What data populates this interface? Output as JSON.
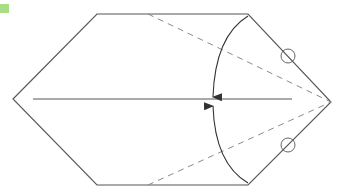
{
  "diagram": {
    "type": "origami-fold-step",
    "colors": {
      "badge": "#a9df84",
      "edge": "#555555",
      "valley_fold": "#8a8a8a",
      "arrow": "#333333",
      "circle": "#666666"
    },
    "outline": [
      [
        13,
        99
      ],
      [
        97,
        14
      ],
      [
        248,
        14
      ],
      [
        331,
        102
      ],
      [
        248,
        185
      ],
      [
        97,
        185
      ]
    ],
    "center_crease": {
      "x1": 33,
      "y1": 99,
      "x2": 292,
      "y2": 99
    },
    "valley_folds": [
      {
        "x1": 148,
        "y1": 14,
        "x2": 331,
        "y2": 102
      },
      {
        "x1": 148,
        "y1": 185,
        "x2": 331,
        "y2": 102
      }
    ],
    "fold_arrows": [
      {
        "from": [
          248,
          16
        ],
        "to": [
          213,
          97
        ],
        "direction": "down"
      },
      {
        "from": [
          248,
          183
        ],
        "to": [
          213,
          106
        ],
        "direction": "up"
      }
    ],
    "reference_circles": [
      {
        "cx": 288,
        "cy": 56,
        "r": 7
      },
      {
        "cx": 288,
        "cy": 145,
        "r": 7
      }
    ]
  }
}
